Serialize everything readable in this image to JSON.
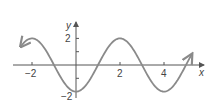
{
  "chart_data": {
    "type": "line",
    "title": "",
    "function": "y = -2cos(pi*x/2)",
    "xlabel": "x",
    "ylabel": "y",
    "xlim": [
      -2.6,
      5.7
    ],
    "ylim": [
      -2.2,
      2.5
    ],
    "x_ticks": [
      -2,
      -1,
      0,
      1,
      2,
      3,
      4,
      5
    ],
    "x_tick_labels": [
      "-2",
      "2",
      "4"
    ],
    "y_ticks": [
      -2,
      -1,
      1,
      2
    ],
    "y_tick_labels": [
      "2",
      "-2"
    ],
    "grid": false,
    "legend": null,
    "series": [
      {
        "name": "curve",
        "x": [
          -2.5,
          -2,
          -1,
          0,
          1,
          2,
          3,
          4,
          5,
          5.25
        ],
        "values": [
          1.41,
          2,
          0,
          -2,
          0,
          2,
          0,
          -2,
          0,
          0.77
        ]
      }
    ],
    "colors": {
      "curve": "#8a8a8a",
      "axes": "#555555"
    }
  },
  "labels": {
    "x_axis": "x",
    "y_axis": "y",
    "tick_neg2": "−2",
    "tick_2": "2",
    "tick_4": "4",
    "y_tick_2": "2",
    "y_tick_neg2": "−2"
  }
}
